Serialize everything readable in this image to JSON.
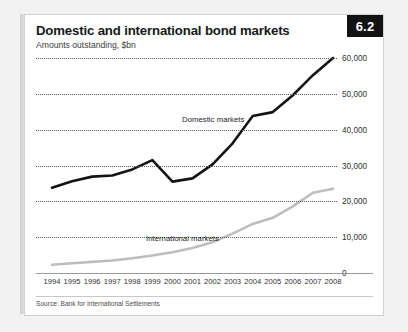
{
  "badge": {
    "label": "6.2"
  },
  "header": {
    "title": "Domestic and international bond markets",
    "subtitle": "Amounts outstanding, $bn"
  },
  "source": {
    "text": "Source: Bank for International Settlements"
  },
  "annotations": {
    "domestic": "Domestic markets",
    "international": "International markets"
  },
  "colors": {
    "domestic_line": "#131313",
    "international_line": "#bdbdbd",
    "gridline": "#5d5d5d",
    "badge_bg": "#121212",
    "badge_text": "#ffffff",
    "card_bg": "#ffffff",
    "page_bg": "#f2f2f2"
  },
  "chart_data": {
    "type": "line",
    "title": "Domestic and international bond markets",
    "subtitle": "Amounts outstanding, $bn",
    "xlabel": "",
    "ylabel": "",
    "ylim": [
      0,
      60000
    ],
    "yticks": [
      0,
      10000,
      20000,
      30000,
      40000,
      50000,
      60000
    ],
    "ytick_labels": [
      "0",
      "10,000",
      "20,000",
      "30,000",
      "40,000",
      "50,000",
      "60,000"
    ],
    "grid": "horizontal-dotted",
    "legend": "inline-annotations",
    "x": [
      1994,
      1995,
      1996,
      1997,
      1998,
      1999,
      2000,
      2001,
      2002,
      2003,
      2004,
      2005,
      2006,
      2007,
      2008
    ],
    "xtick_labels": [
      "1994",
      "1995",
      "1996",
      "1997",
      "1998",
      "1999",
      "2000",
      "2001",
      "2002",
      "2003",
      "2004",
      "2005",
      "2006",
      "2007",
      "2008"
    ],
    "series": [
      {
        "name": "Domestic markets",
        "color": "#131313",
        "values": [
          23800,
          25600,
          26900,
          27200,
          28900,
          31500,
          25500,
          26400,
          30300,
          36200,
          43800,
          44900,
          49600,
          55200,
          60000
        ]
      },
      {
        "name": "International markets",
        "color": "#bdbdbd",
        "values": [
          2300,
          2700,
          3100,
          3500,
          4100,
          4900,
          5800,
          7000,
          8600,
          11000,
          13700,
          15400,
          18600,
          22400,
          23500
        ]
      }
    ]
  }
}
